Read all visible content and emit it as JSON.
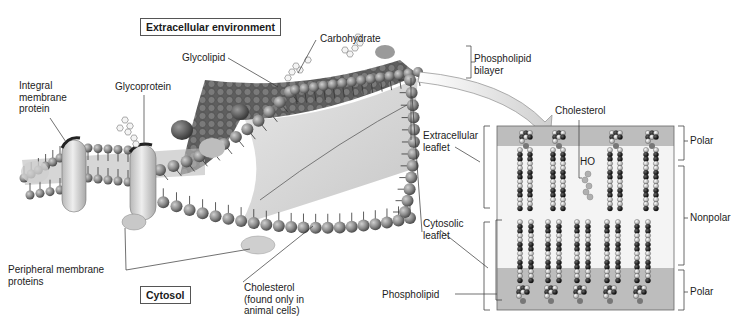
{
  "figure": {
    "region_labels": {
      "extracellular": "Extracellular environment",
      "cytosol": "Cytosol"
    },
    "left_labels": [
      {
        "id": "integral",
        "text": "Integral\nmembrane\nprotein"
      },
      {
        "id": "glycoprotein",
        "text": "Glycoprotein"
      },
      {
        "id": "glycolipid",
        "text": "Glycolipid"
      },
      {
        "id": "carbohydrate",
        "text": "Carbohydrate"
      },
      {
        "id": "bilayer",
        "text": "Phospholipid\nbilayer"
      },
      {
        "id": "extracellular_leaflet",
        "text": "Extracellular\nleaflet"
      },
      {
        "id": "cytosolic_leaflet",
        "text": "Cytosolic\nleaflet"
      },
      {
        "id": "peripheral",
        "text": "Peripheral membrane\nproteins"
      },
      {
        "id": "cholesterol_animal",
        "text": "Cholesterol\n(found only in\nanimal cells)"
      }
    ],
    "inset": {
      "cholesterol_label": "Cholesterol",
      "ho_label": "HO",
      "phospholipid_label": "Phospholipid",
      "regions": [
        {
          "id": "polar_top",
          "text": "Polar"
        },
        {
          "id": "nonpolar",
          "text": "Nonpolar"
        },
        {
          "id": "polar_bottom",
          "text": "Polar"
        }
      ]
    },
    "caption": "Figure 3.4"
  },
  "colors": {
    "head": "#8c8c8c",
    "head_dark": "#5a5a5a",
    "surface": "#6a6a6a",
    "protein": "#d9d9d9",
    "polar_band": "#bdbdbd",
    "inset_bg": "#e6e6e6"
  }
}
